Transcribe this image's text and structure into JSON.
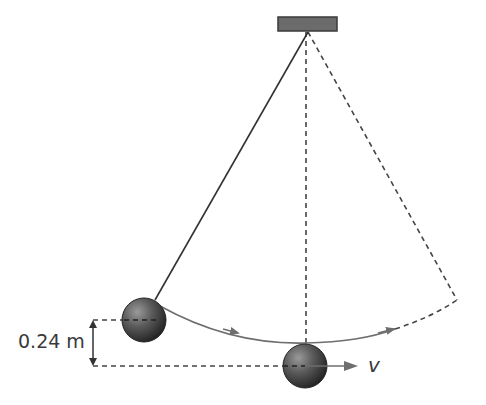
{
  "diagram": {
    "height_label": "0.24 m",
    "velocity_label": "v",
    "colors": {
      "line": "#333333",
      "arc": "#6e6e6e",
      "support": "#6b6b6b",
      "support_border": "#3a3a3a",
      "ball_dark": "#2a2a2a",
      "ball_light": "#8c8c8c"
    },
    "elements": [
      {
        "name": "pivot-support",
        "shape": "rect"
      },
      {
        "name": "string-displaced",
        "shape": "line",
        "style": "solid"
      },
      {
        "name": "string-vertical",
        "shape": "line",
        "style": "dashed"
      },
      {
        "name": "string-far-side",
        "shape": "line",
        "style": "dashed"
      },
      {
        "name": "swing-arc",
        "shape": "arc",
        "arrows": 2
      },
      {
        "name": "bob-raised",
        "shape": "sphere"
      },
      {
        "name": "bob-lowest",
        "shape": "sphere"
      },
      {
        "name": "height-dimension",
        "shape": "double-arrow"
      },
      {
        "name": "velocity-arrow",
        "shape": "arrow"
      }
    ]
  }
}
